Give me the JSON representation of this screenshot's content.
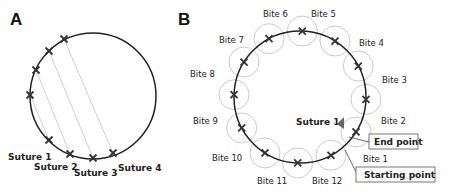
{
  "panels": {
    "a": {
      "label": "A",
      "sutures": [
        {
          "label": "Suture 1"
        },
        {
          "label": "Suture 2"
        },
        {
          "label": "Suture 3"
        },
        {
          "label": "Suture 4"
        }
      ]
    },
    "b": {
      "label": "B",
      "suture_label": "Suture 1",
      "end_point_label": "End point",
      "starting_point_label": "Starting point",
      "bites": [
        {
          "label": "Bite 1"
        },
        {
          "label": "Bite 2"
        },
        {
          "label": "Bite 3"
        },
        {
          "label": "Bite 4"
        },
        {
          "label": "Bite 5"
        },
        {
          "label": "Bite 6"
        },
        {
          "label": "Bite 7"
        },
        {
          "label": "Bite 8"
        },
        {
          "label": "Bite 9"
        },
        {
          "label": "Bite 10"
        },
        {
          "label": "Bite 11"
        },
        {
          "label": "Bite 12"
        }
      ]
    }
  },
  "colors": {
    "circle": "#222222",
    "marker": "#333333",
    "guide": "#b8b8b8",
    "arrow": "#666666"
  }
}
